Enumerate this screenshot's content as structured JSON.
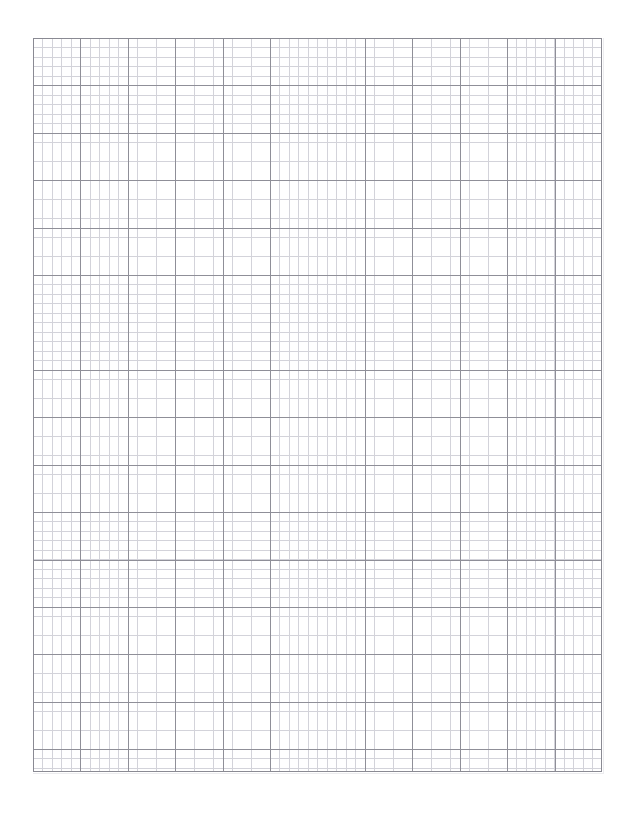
{
  "page": {
    "title": "Graph Paper",
    "background_color": "#ffffff",
    "width_px": 634,
    "height_px": 814
  },
  "grid": {
    "label": "Graph Paper Grid",
    "origin_x_px": 33,
    "origin_y_px": 38,
    "width_px": 569,
    "height_px": 734,
    "minor_spacing_px": 9.48,
    "major_spacing_px": 47.42,
    "minor_per_major": 5,
    "major_columns": 12,
    "major_rows": 15.5,
    "minor_columns": 60,
    "minor_rows": 77,
    "minor_line_color": "#d3d3da",
    "major_line_color": "#8f8f98",
    "border_color": "#8a8a93",
    "minor_line_width_px": 0.7,
    "major_line_width_px": 0.9,
    "border_width_px": 1
  },
  "margins": {
    "left_px": 33,
    "top_px": 38,
    "right_px": 32,
    "bottom_px": 42
  },
  "chart_data": {
    "type": "grid",
    "title": "Graph Paper",
    "xlabel": "",
    "ylabel": "",
    "series": [],
    "categories": [],
    "values": [],
    "grid": true,
    "legend": "none",
    "xlim": [
      0,
      12
    ],
    "ylim": [
      0,
      15.5
    ]
  }
}
